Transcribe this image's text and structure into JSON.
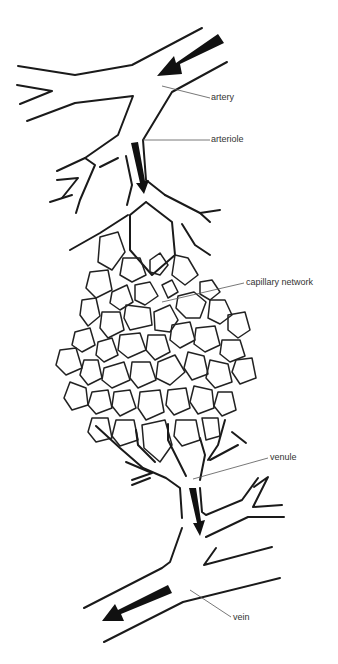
{
  "diagram": {
    "colors": {
      "stroke": "#1a1a1a",
      "arrow": "#111111",
      "leader": "#555555",
      "background": "#ffffff"
    },
    "labels": [
      {
        "id": "artery",
        "text": "artery",
        "x": 211,
        "y": 93
      },
      {
        "id": "arteriole",
        "text": "arteriole",
        "x": 211,
        "y": 135
      },
      {
        "id": "capillary-network",
        "text": "capillary network",
        "x": 246,
        "y": 278
      },
      {
        "id": "venule",
        "text": "venule",
        "x": 270,
        "y": 453
      },
      {
        "id": "vein",
        "text": "vein",
        "x": 233,
        "y": 613
      }
    ],
    "flow_arrows": [
      {
        "id": "artery-flow",
        "direction": "down-left"
      },
      {
        "id": "arteriole-flow",
        "direction": "down"
      },
      {
        "id": "venule-flow",
        "direction": "down"
      },
      {
        "id": "vein-flow",
        "direction": "down-left"
      }
    ]
  }
}
